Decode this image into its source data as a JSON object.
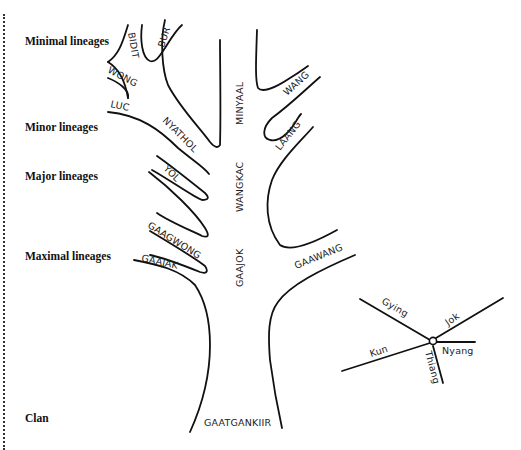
{
  "levels": {
    "minimal": "Minimal lineages",
    "minor": "Minor lineages",
    "major": "Major lineages",
    "maximal": "Maximal lineages",
    "clan": "Clan"
  },
  "lineages": {
    "bidit": "BIDIT",
    "bur": "BUR",
    "wong": "WONG",
    "luc": "LUC",
    "nyathol": "NYATHOL",
    "minyaal": "MINYAAL",
    "wang": "WANG",
    "laang": "LAANG",
    "yol": "YOL",
    "wangkac": "WANGKAC",
    "gaagwong": "GAAGWONG",
    "gaajak": "GAAJAK",
    "gaajok": "GAAJOK",
    "gaawang": "GAAWANG",
    "gaatgankiir": "GAATGANKIIR"
  },
  "compass": {
    "gying": "Gying",
    "jok": "Jok",
    "kun": "Kun",
    "nyang": "Nyang",
    "thiang": "Thiang"
  }
}
